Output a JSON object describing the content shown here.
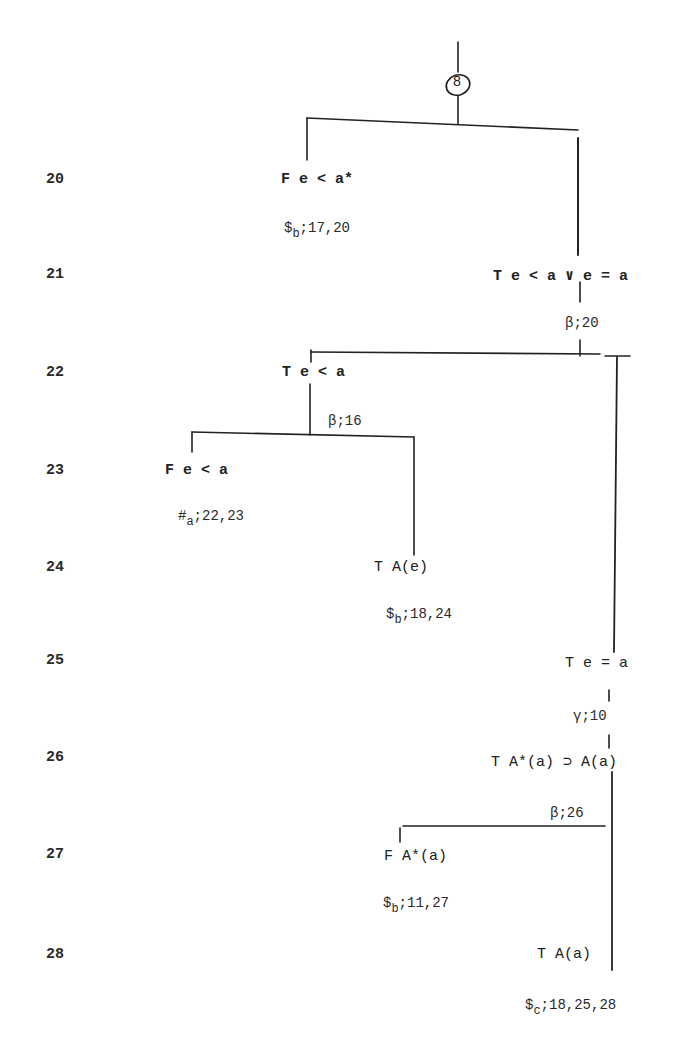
{
  "diagram": {
    "type": "semantic-tableau-proof-tree",
    "branch_marker": "8",
    "line_numbers": [
      "20",
      "21",
      "22",
      "23",
      "24",
      "25",
      "26",
      "27",
      "28"
    ],
    "nodes": [
      {
        "id": "n20",
        "line": "20",
        "text": "F e < a*",
        "justification": {
          "symbol": "$",
          "sub": "b",
          "refs": ";17,20"
        }
      },
      {
        "id": "n21",
        "line": "21",
        "text": "T e < a ∨ e = a",
        "justification": {
          "symbol": "β",
          "sub": "",
          "refs": ";20"
        }
      },
      {
        "id": "n22",
        "line": "22",
        "text": "T e < a",
        "justification": {
          "symbol": "β",
          "sub": "",
          "refs": ";16"
        }
      },
      {
        "id": "n23",
        "line": "23",
        "text": "F e < a",
        "justification": {
          "symbol": "#",
          "sub": "a",
          "refs": ";22,23"
        }
      },
      {
        "id": "n24",
        "line": "24",
        "text": "T A(e)",
        "justification": {
          "symbol": "$",
          "sub": "b",
          "refs": ";18,24"
        }
      },
      {
        "id": "n25",
        "line": "25",
        "text": "T e = a",
        "justification": {
          "symbol": "γ",
          "sub": "",
          "refs": ";10"
        }
      },
      {
        "id": "n26",
        "line": "26",
        "text": "T A*(a) ⊃ A(a)",
        "justification": {
          "symbol": "β",
          "sub": "",
          "refs": ";26"
        }
      },
      {
        "id": "n27",
        "line": "27",
        "text": "F A*(a)",
        "justification": {
          "symbol": "$",
          "sub": "b",
          "refs": ";11,27"
        }
      },
      {
        "id": "n28",
        "line": "28",
        "text": "T A(a)",
        "justification": {
          "symbol": "$",
          "sub": "c",
          "refs": ";18,25,28"
        }
      }
    ]
  }
}
